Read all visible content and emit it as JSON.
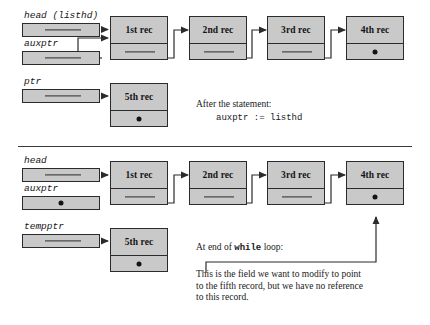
{
  "figure": {
    "record_label_suffix": "rec"
  },
  "colors": {
    "box_fill": "#c9c9c9",
    "stroke": "#2b2b2b",
    "text": "#1a1a1a",
    "background": "#ffffff"
  },
  "panels": [
    {
      "id": "top",
      "variables": [
        {
          "name": "head-listhd",
          "label": "head (listhd)",
          "value_kind": "pointer"
        },
        {
          "name": "auxptr",
          "label": "auxptr",
          "value_kind": "pointer"
        },
        {
          "name": "ptr",
          "label": "ptr",
          "value_kind": "pointer"
        }
      ],
      "records": [
        {
          "label": "1st rec",
          "next": "pointer"
        },
        {
          "label": "2nd rec",
          "next": "pointer"
        },
        {
          "label": "3rd rec",
          "next": "pointer"
        },
        {
          "label": "4th rec",
          "next": "nil"
        }
      ],
      "detached_record": {
        "label": "5th rec",
        "next": "nil"
      },
      "caption": {
        "line1": "After the statement:",
        "line2": "auxptr := listhd"
      }
    },
    {
      "id": "bottom",
      "variables": [
        {
          "name": "head",
          "label": "head",
          "value_kind": "pointer"
        },
        {
          "name": "auxptr",
          "label": "auxptr",
          "value_kind": "nil"
        },
        {
          "name": "tempptr",
          "label": "tempptr",
          "value_kind": "pointer"
        }
      ],
      "records": [
        {
          "label": "1st rec",
          "next": "pointer"
        },
        {
          "label": "2nd rec",
          "next": "pointer"
        },
        {
          "label": "3rd rec",
          "next": "pointer"
        },
        {
          "label": "4th rec",
          "next": "nil"
        }
      ],
      "detached_record": {
        "label": "5th rec",
        "next": "nil"
      },
      "caption": {
        "line1_prefix": "At end of ",
        "line1_keyword": "while",
        "line1_suffix": " loop:"
      },
      "annotation": "This is the field we want to modify to point to the fifth record, but we have no reference to this record."
    }
  ]
}
